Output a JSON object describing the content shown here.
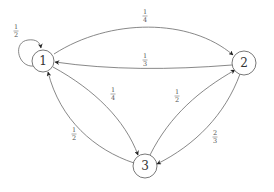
{
  "diagram": {
    "type": "markov-chain",
    "nodes": [
      {
        "id": "1",
        "label": "1"
      },
      {
        "id": "2",
        "label": "2"
      },
      {
        "id": "3",
        "label": "3"
      }
    ],
    "edges": [
      {
        "from": "1",
        "to": "1",
        "num": "1",
        "den": "2"
      },
      {
        "from": "1",
        "to": "2",
        "num": "1",
        "den": "4"
      },
      {
        "from": "2",
        "to": "1",
        "num": "1",
        "den": "3"
      },
      {
        "from": "1",
        "to": "3",
        "num": "1",
        "den": "4"
      },
      {
        "from": "3",
        "to": "1",
        "num": "1",
        "den": "2"
      },
      {
        "from": "3",
        "to": "2",
        "num": "1",
        "den": "2"
      },
      {
        "from": "2",
        "to": "3",
        "num": "2",
        "den": "3"
      }
    ]
  }
}
